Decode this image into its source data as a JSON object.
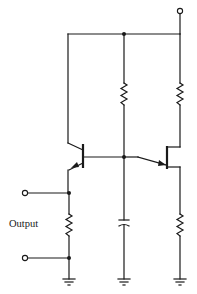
{
  "diagram": {
    "type": "circuit-schematic",
    "labels": {
      "output": "Output"
    },
    "components": [
      {
        "id": "Q1",
        "kind": "npn-transistor"
      },
      {
        "id": "Q2",
        "kind": "pnp-transistor"
      },
      {
        "id": "R-mid",
        "kind": "resistor"
      },
      {
        "id": "R-right-top",
        "kind": "resistor"
      },
      {
        "id": "R-left",
        "kind": "resistor"
      },
      {
        "id": "R-right-bottom",
        "kind": "resistor"
      },
      {
        "id": "C1",
        "kind": "capacitor"
      },
      {
        "id": "supply-terminal",
        "kind": "terminal"
      },
      {
        "id": "output-terminals",
        "kind": "terminal-pair"
      },
      {
        "id": "grounds",
        "kind": "ground",
        "count": 3
      }
    ],
    "colors": {
      "ink": "#1a1a1a",
      "background": "#ffffff"
    }
  }
}
